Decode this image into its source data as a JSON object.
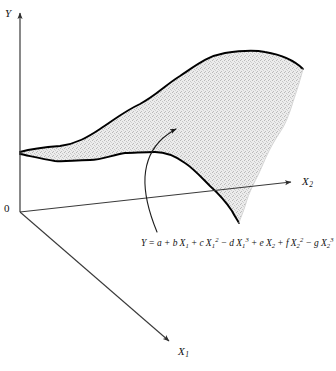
{
  "figure": {
    "type": "3d-response-surface-diagram",
    "caption": "",
    "axes": {
      "vertical": {
        "name": "Y",
        "label": "Y",
        "arrow": "up"
      },
      "right": {
        "name": "X2",
        "label": "X",
        "subscript": "2",
        "arrow": "right"
      },
      "front": {
        "name": "X1",
        "label": "X",
        "subscript": "1",
        "arrow": "down-right"
      },
      "origin_label": "0"
    },
    "annotation": {
      "leader": "curved-arrow",
      "points_to": "response-surface",
      "equation_plain": "Y = a + b X1 + cX1^2 - dX1^3 + eX2 + fX2^2 - gX2^3",
      "equation_parts": [
        {
          "text": "Y",
          "style": "var"
        },
        {
          "text": "=",
          "style": "op"
        },
        {
          "text": "a",
          "style": "var"
        },
        {
          "text": "+",
          "style": "op"
        },
        {
          "text": "b",
          "style": "var"
        },
        {
          "text": "X",
          "sub": "1",
          "style": "var"
        },
        {
          "text": "+",
          "style": "op"
        },
        {
          "text": "c",
          "style": "var"
        },
        {
          "text": "X",
          "sub": "1",
          "sup": "2",
          "style": "var"
        },
        {
          "text": "−",
          "style": "op"
        },
        {
          "text": "d",
          "style": "var"
        },
        {
          "text": "X",
          "sub": "1",
          "sup": "3",
          "style": "var"
        },
        {
          "text": "+",
          "style": "op"
        },
        {
          "text": "e",
          "style": "var"
        },
        {
          "text": "X",
          "sub": "2",
          "style": "var"
        },
        {
          "text": "+",
          "style": "op"
        },
        {
          "text": "f",
          "style": "var"
        },
        {
          "text": "X",
          "sub": "2",
          "sup": "2",
          "style": "var"
        },
        {
          "text": "−",
          "style": "op"
        },
        {
          "text": "g",
          "style": "var"
        },
        {
          "text": "X",
          "sub": "2",
          "sup": "3",
          "style": "var"
        }
      ]
    },
    "surface": {
      "fill": "#e3e3e3",
      "stroke": "#000000",
      "texture": "stipple",
      "description": "shaded curved response surface"
    },
    "colors": {
      "ink": "#111111",
      "axis": "#3a3a3a",
      "surface_fill": "#e3e3e3",
      "surface_edge": "#000000",
      "background": "#ffffff"
    }
  },
  "chart_data": {
    "type": "surface",
    "title": "",
    "xlabel": "X1",
    "ylabel": "X2",
    "zlabel": "Y",
    "equation": "Y = a + b X₁ + cX₁² − dX₁³ + eX₂ + fX₂² − gX₂³",
    "terms": [
      {
        "coefficient": "a",
        "variable": "",
        "power": 0,
        "sign": "+"
      },
      {
        "coefficient": "b",
        "variable": "X1",
        "power": 1,
        "sign": "+"
      },
      {
        "coefficient": "c",
        "variable": "X1",
        "power": 2,
        "sign": "+"
      },
      {
        "coefficient": "d",
        "variable": "X1",
        "power": 3,
        "sign": "-"
      },
      {
        "coefficient": "e",
        "variable": "X2",
        "power": 1,
        "sign": "+"
      },
      {
        "coefficient": "f",
        "variable": "X2",
        "power": 2,
        "sign": "+"
      },
      {
        "coefficient": "g",
        "variable": "X2",
        "power": 3,
        "sign": "-"
      }
    ],
    "grid": false,
    "legend": "none",
    "axis_arrows": true,
    "back_edge_points": [
      [
        20,
        152
      ],
      [
        60,
        146
      ],
      [
        100,
        129
      ],
      [
        140,
        104
      ],
      [
        180,
        76
      ],
      [
        225,
        53
      ],
      [
        265,
        52
      ],
      [
        303,
        69
      ]
    ],
    "front_edge_points": [
      [
        20,
        154
      ],
      [
        55,
        161
      ],
      [
        90,
        160
      ],
      [
        125,
        153
      ],
      [
        155,
        152
      ],
      [
        185,
        163
      ],
      [
        210,
        186
      ],
      [
        232,
        211
      ],
      [
        239,
        223
      ]
    ],
    "right_edge_points": [
      [
        303,
        69
      ],
      [
        292,
        105
      ],
      [
        275,
        140
      ],
      [
        258,
        175
      ],
      [
        246,
        203
      ],
      [
        239,
        223
      ]
    ]
  }
}
